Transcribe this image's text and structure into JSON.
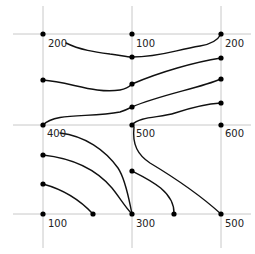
{
  "diagram": {
    "type": "contour-interpolation-grid",
    "colors": {
      "grid": "#c8c8c8",
      "curve": "#111111",
      "node": "#000000",
      "text": "#222222"
    },
    "grid": {
      "vertical_x": [
        43,
        132,
        221
      ],
      "horizontal_y": [
        34,
        125,
        214
      ]
    },
    "corner_values": [
      {
        "id": "tl",
        "x": 43,
        "y": 34,
        "value": "200"
      },
      {
        "id": "tm",
        "x": 132,
        "y": 34,
        "value": "100"
      },
      {
        "id": "tr",
        "x": 221,
        "y": 34,
        "value": "200"
      },
      {
        "id": "ml",
        "x": 43,
        "y": 125,
        "value": "400"
      },
      {
        "id": "mm",
        "x": 132,
        "y": 125,
        "value": "500"
      },
      {
        "id": "mr",
        "x": 221,
        "y": 125,
        "value": "600"
      },
      {
        "id": "bl",
        "x": 43,
        "y": 214,
        "value": "100"
      },
      {
        "id": "bm",
        "x": 132,
        "y": 214,
        "value": "300"
      },
      {
        "id": "br",
        "x": 221,
        "y": 214,
        "value": "500"
      }
    ],
    "labels": {
      "tl": "200",
      "tm": "100",
      "tr": "200",
      "ml": "400",
      "mm": "500",
      "mr": "600",
      "bl": "100",
      "bm": "300",
      "br": "500"
    },
    "intermediate_nodes": [
      {
        "x": 43,
        "y": 80
      },
      {
        "x": 132,
        "y": 57
      },
      {
        "x": 132,
        "y": 84
      },
      {
        "x": 132,
        "y": 107
      },
      {
        "x": 221,
        "y": 58
      },
      {
        "x": 221,
        "y": 79
      },
      {
        "x": 221,
        "y": 103
      },
      {
        "x": 43,
        "y": 155
      },
      {
        "x": 43,
        "y": 184
      },
      {
        "x": 132,
        "y": 171
      },
      {
        "x": 93,
        "y": 214
      },
      {
        "x": 174,
        "y": 214
      }
    ],
    "contours": [
      {
        "id": "c1",
        "d": "M 66 43 C 80 50, 95 52, 110 54 C 120 55, 126 57, 132 57 C 160 57, 175 50, 200 46 C 212 44, 218 40, 221 34"
      },
      {
        "id": "c2",
        "d": "M 43 80 C 70 82, 95 94, 120 90 C 126 89, 130 86, 132 84 C 160 72, 195 62, 221 58"
      },
      {
        "id": "c3",
        "d": "M 43 125 C 55 112, 90 118, 120 112 C 126 110, 130 108, 132 107 C 160 95, 200 88, 221 79"
      },
      {
        "id": "c4",
        "d": "M 132 125 C 140 116, 160 118, 175 113 C 190 108, 205 104, 221 103"
      },
      {
        "id": "c5",
        "d": "M 60 133 C 95 140, 110 158, 125 170 C 150 190, 200 190, 221 214"
      },
      {
        "id": "c5b",
        "d": "M 134 127 C 132 145, 138 155, 150 163 C 175 178, 200 195, 221 214"
      },
      {
        "id": "c6",
        "d": "M 43 155 C 75 158, 95 170, 115 180 C 125 186, 130 188, 132 171"
      },
      {
        "id": "c7",
        "d": "M 43 184 C 65 190, 80 200, 93 214"
      },
      {
        "id": "c8",
        "d": "M 132 171 C 150 180, 175 192, 174 214"
      }
    ]
  }
}
